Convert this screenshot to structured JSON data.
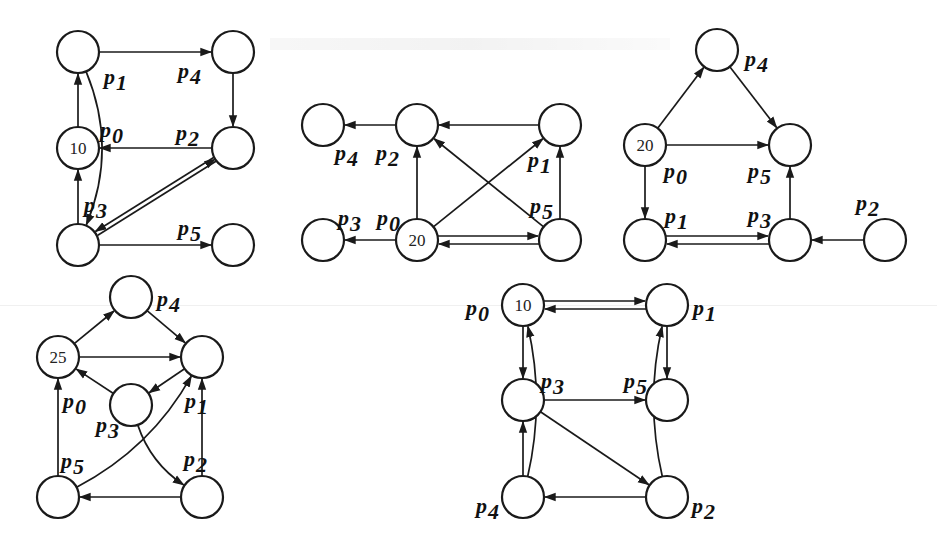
{
  "figure": {
    "node_radius": 21,
    "colors": {
      "stroke": "#1a1a1a",
      "background": "#ffffff",
      "text": "#111111"
    },
    "panels": [
      {
        "id": "A",
        "nodes": [
          {
            "id": "p1",
            "x": 78,
            "y": 52,
            "value": "",
            "label": "p",
            "sub": "1",
            "lx": 104,
            "ly": 84
          },
          {
            "id": "p4",
            "x": 233,
            "y": 52,
            "value": "",
            "label": "p",
            "sub": "4",
            "lx": 178,
            "ly": 78
          },
          {
            "id": "p0",
            "x": 78,
            "y": 148,
            "value": "10",
            "label": "p",
            "sub": "0",
            "lx": 100,
            "ly": 137
          },
          {
            "id": "p2",
            "x": 233,
            "y": 148,
            "value": "",
            "label": "p",
            "sub": "2",
            "lx": 176,
            "ly": 140
          },
          {
            "id": "p3",
            "x": 78,
            "y": 245,
            "value": "",
            "label": "p",
            "sub": "3",
            "lx": 84,
            "ly": 212
          },
          {
            "id": "p5",
            "x": 233,
            "y": 245,
            "value": "",
            "label": "p",
            "sub": "5",
            "lx": 178,
            "ly": 235
          }
        ],
        "edges": [
          {
            "from": "p1",
            "to": "p4"
          },
          {
            "from": "p4",
            "to": "p2"
          },
          {
            "from": "p2",
            "to": "p0"
          },
          {
            "from": "p0",
            "to": "p1"
          },
          {
            "from": "p3",
            "to": "p0"
          },
          {
            "from": "p1",
            "to": "p3",
            "curve": -40
          },
          {
            "from": "p3",
            "to": "p5"
          },
          {
            "from": "p2",
            "to": "p3",
            "double": true
          }
        ]
      },
      {
        "id": "B",
        "nodes": [
          {
            "id": "p4",
            "x": 323,
            "y": 125,
            "value": "",
            "label": "p",
            "sub": "4",
            "lx": 335,
            "ly": 160
          },
          {
            "id": "p2",
            "x": 417,
            "y": 125,
            "value": "",
            "label": "p",
            "sub": "2",
            "lx": 376,
            "ly": 160
          },
          {
            "id": "p1",
            "x": 560,
            "y": 125,
            "value": "",
            "label": "p",
            "sub": "1",
            "lx": 528,
            "ly": 167
          },
          {
            "id": "p3",
            "x": 323,
            "y": 240,
            "value": "",
            "label": "p",
            "sub": "3",
            "lx": 338,
            "ly": 225
          },
          {
            "id": "p0",
            "x": 417,
            "y": 240,
            "value": "20",
            "label": "p",
            "sub": "0",
            "lx": 377,
            "ly": 225
          },
          {
            "id": "p5",
            "x": 560,
            "y": 240,
            "value": "",
            "label": "p",
            "sub": "5",
            "lx": 530,
            "ly": 213
          }
        ],
        "edges": [
          {
            "from": "p2",
            "to": "p4"
          },
          {
            "from": "p1",
            "to": "p2"
          },
          {
            "from": "p0",
            "to": "p2"
          },
          {
            "from": "p0",
            "to": "p1"
          },
          {
            "from": "p5",
            "to": "p2"
          },
          {
            "from": "p5",
            "to": "p1"
          },
          {
            "from": "p0",
            "to": "p3"
          },
          {
            "from": "p0",
            "to": "p5",
            "offset": -4
          },
          {
            "from": "p5",
            "to": "p0",
            "offset": -4
          }
        ]
      },
      {
        "id": "C",
        "nodes": [
          {
            "id": "p4",
            "x": 717,
            "y": 50,
            "value": "",
            "label": "p",
            "sub": "4",
            "lx": 745,
            "ly": 66
          },
          {
            "id": "p0",
            "x": 645,
            "y": 145,
            "value": "20",
            "label": "p",
            "sub": "0",
            "lx": 664,
            "ly": 178
          },
          {
            "id": "p5",
            "x": 790,
            "y": 145,
            "value": "",
            "label": "p",
            "sub": "5",
            "lx": 748,
            "ly": 178
          },
          {
            "id": "p1",
            "x": 645,
            "y": 240,
            "value": "",
            "label": "p",
            "sub": "1",
            "lx": 665,
            "ly": 223
          },
          {
            "id": "p3",
            "x": 790,
            "y": 240,
            "value": "",
            "label": "p",
            "sub": "3",
            "lx": 748,
            "ly": 222
          },
          {
            "id": "p2",
            "x": 885,
            "y": 240,
            "value": "",
            "label": "p",
            "sub": "2",
            "lx": 856,
            "ly": 210
          }
        ],
        "edges": [
          {
            "from": "p0",
            "to": "p4"
          },
          {
            "from": "p4",
            "to": "p5"
          },
          {
            "from": "p0",
            "to": "p5"
          },
          {
            "from": "p0",
            "to": "p1"
          },
          {
            "from": "p1",
            "to": "p3",
            "offset": -4
          },
          {
            "from": "p3",
            "to": "p1",
            "offset": -4
          },
          {
            "from": "p3",
            "to": "p5"
          },
          {
            "from": "p2",
            "to": "p3"
          }
        ]
      },
      {
        "id": "D",
        "nodes": [
          {
            "id": "p4",
            "x": 131,
            "y": 297,
            "value": "",
            "label": "p",
            "sub": "4",
            "lx": 157,
            "ly": 306
          },
          {
            "id": "p0",
            "x": 58,
            "y": 357,
            "value": "25",
            "label": "p",
            "sub": "0",
            "lx": 63,
            "ly": 408
          },
          {
            "id": "p1",
            "x": 202,
            "y": 357,
            "value": "",
            "label": "p",
            "sub": "1",
            "lx": 185,
            "ly": 408
          },
          {
            "id": "p3",
            "x": 131,
            "y": 405,
            "value": "",
            "label": "p",
            "sub": "3",
            "lx": 96,
            "ly": 432
          },
          {
            "id": "p5",
            "x": 58,
            "y": 497,
            "value": "",
            "label": "p",
            "sub": "5",
            "lx": 61,
            "ly": 468
          },
          {
            "id": "p2",
            "x": 202,
            "y": 497,
            "value": "",
            "label": "p",
            "sub": "2",
            "lx": 184,
            "ly": 466
          }
        ],
        "edges": [
          {
            "from": "p0",
            "to": "p4"
          },
          {
            "from": "p4",
            "to": "p1"
          },
          {
            "from": "p0",
            "to": "p1"
          },
          {
            "from": "p1",
            "to": "p3"
          },
          {
            "from": "p3",
            "to": "p0"
          },
          {
            "from": "p3",
            "to": "p2",
            "curve": 20
          },
          {
            "from": "p5",
            "to": "p1",
            "curve": 30
          },
          {
            "from": "p5",
            "to": "p0"
          },
          {
            "from": "p2",
            "to": "p1"
          },
          {
            "from": "p2",
            "to": "p5"
          }
        ]
      },
      {
        "id": "E",
        "nodes": [
          {
            "id": "p0",
            "x": 523,
            "y": 305,
            "value": "10",
            "label": "p",
            "sub": "0",
            "lx": 466,
            "ly": 315
          },
          {
            "id": "p1",
            "x": 667,
            "y": 305,
            "value": "",
            "label": "p",
            "sub": "1",
            "lx": 693,
            "ly": 315
          },
          {
            "id": "p3",
            "x": 523,
            "y": 400,
            "value": "",
            "label": "p",
            "sub": "3",
            "lx": 541,
            "ly": 388
          },
          {
            "id": "p5",
            "x": 667,
            "y": 400,
            "value": "",
            "label": "p",
            "sub": "5",
            "lx": 624,
            "ly": 388
          },
          {
            "id": "p4",
            "x": 523,
            "y": 497,
            "value": "",
            "label": "p",
            "sub": "4",
            "lx": 476,
            "ly": 513
          },
          {
            "id": "p2",
            "x": 667,
            "y": 497,
            "value": "",
            "label": "p",
            "sub": "2",
            "lx": 692,
            "ly": 513
          }
        ],
        "edges": [
          {
            "from": "p0",
            "to": "p1",
            "offset": -4
          },
          {
            "from": "p1",
            "to": "p0",
            "offset": -4
          },
          {
            "from": "p0",
            "to": "p3"
          },
          {
            "from": "p1",
            "to": "p5"
          },
          {
            "from": "p3",
            "to": "p5"
          },
          {
            "from": "p3",
            "to": "p2"
          },
          {
            "from": "p4",
            "to": "p3"
          },
          {
            "from": "p2",
            "to": "p4"
          },
          {
            "from": "p4",
            "to": "p0",
            "curve": 22
          },
          {
            "from": "p2",
            "to": "p1",
            "curve": -22
          }
        ]
      }
    ]
  }
}
